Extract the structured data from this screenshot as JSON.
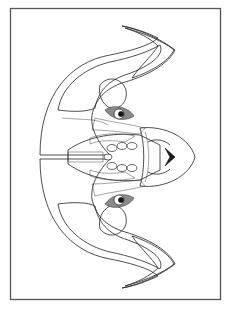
{
  "image": {
    "subject": "Zentangle ram head coloring page",
    "orientation": "rotated 90 degrees, snout pointing right",
    "colors": {
      "background": "#ffffff",
      "ink": "#222222",
      "frame": "#555555"
    },
    "elements": [
      {
        "name": "frame",
        "description": "thin rectangular border"
      },
      {
        "name": "upper-horn",
        "description": "curving horn with woven, striped and scale patterns"
      },
      {
        "name": "lower-horn",
        "description": "mirrored curving horn with woven, striped and scale patterns"
      },
      {
        "name": "upper-eye",
        "description": "eye with dark dotted patch"
      },
      {
        "name": "lower-eye",
        "description": "eye with dark dotted patch"
      },
      {
        "name": "forehead",
        "description": "central band of ovals, grid and checker patterns"
      },
      {
        "name": "snout",
        "description": "grid-patterned nose with dark nostril marks"
      }
    ]
  }
}
